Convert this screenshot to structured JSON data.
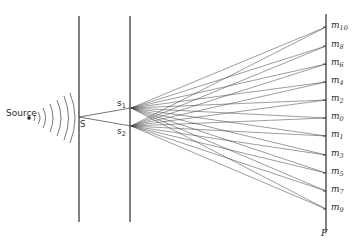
{
  "labels": {
    "source": "Source",
    "slit_single": "S",
    "slit_1": {
      "base": "s",
      "sub": "1"
    },
    "slit_2": {
      "base": "s",
      "sub": "2"
    },
    "screen": "F"
  },
  "fringes": [
    {
      "base": "m",
      "sub": "10",
      "y": 27
    },
    {
      "base": "m",
      "sub": "8",
      "y": 46
    },
    {
      "base": "m",
      "sub": "6",
      "y": 64
    },
    {
      "base": "m",
      "sub": "4",
      "y": 82
    },
    {
      "base": "m",
      "sub": "2",
      "y": 100
    },
    {
      "base": "m",
      "sub": "0",
      "y": 118
    },
    {
      "base": "m",
      "sub": "1",
      "y": 136
    },
    {
      "base": "m",
      "sub": "3",
      "y": 155
    },
    {
      "base": "m",
      "sub": "5",
      "y": 173
    },
    {
      "base": "m",
      "sub": "7",
      "y": 191
    },
    {
      "base": "m",
      "sub": "9",
      "y": 209
    }
  ],
  "geometry": {
    "barrier1_x": 79,
    "barrier2_x": 130,
    "barrier_top": 16,
    "barrier_bottom": 222,
    "S": [
      79,
      117
    ],
    "s1": [
      131,
      108
    ],
    "s2": [
      131,
      126
    ],
    "screen_x": 326,
    "screen_top": 14,
    "screen_bottom": 232,
    "source_dot": [
      29,
      118
    ]
  },
  "colors": {
    "line": "#2b2b2b",
    "ray": "#3a3a3a",
    "wave": "#555555"
  }
}
